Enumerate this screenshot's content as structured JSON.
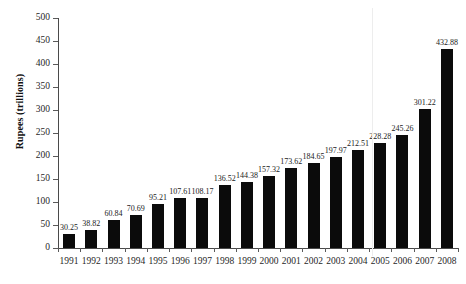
{
  "chart_data": {
    "type": "bar",
    "title": "",
    "xlabel": "",
    "ylabel": "Rupees (trillions)",
    "categories": [
      "1991",
      "1992",
      "1993",
      "1994",
      "1995",
      "1996",
      "1997",
      "1998",
      "1999",
      "2000",
      "2001",
      "2002",
      "2003",
      "2004",
      "2005",
      "2006",
      "2007",
      "2008"
    ],
    "values": [
      30.25,
      38.82,
      60.84,
      70.69,
      95.21,
      107.61,
      108.17,
      136.52,
      144.38,
      157.32,
      173.62,
      184.65,
      197.97,
      212.51,
      228.28,
      245.26,
      301.22,
      432.88
    ],
    "data_labels": [
      "30.25",
      "38.82",
      "60.84",
      "70.69",
      "95.21",
      "107.61",
      "108.17",
      "136.52",
      "144.38",
      "157.32",
      "173.62",
      "184.65",
      "197.97",
      "212.51",
      "228.28",
      "245.26",
      "301.22",
      "432.88"
    ],
    "ylim": [
      0,
      500
    ],
    "ytick_values": [
      0,
      50,
      100,
      150,
      200,
      250,
      300,
      350,
      400,
      450,
      500
    ],
    "ytick_labels": [
      "0",
      "50",
      "100",
      "150",
      "200",
      "250",
      "300",
      "350",
      "400",
      "450",
      "500"
    ],
    "grid": false,
    "legend": null,
    "bar_color": "#0b0b0b",
    "axis_color": "#4a4a4a",
    "background": "#ffffff"
  }
}
